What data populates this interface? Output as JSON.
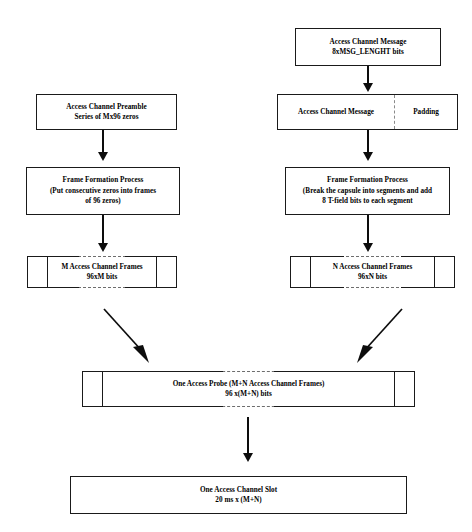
{
  "diagram": {
    "colors": {
      "stroke": "#1a1a1a",
      "dashed": "#6d6d6d",
      "background": "#ffffff",
      "text": "#000000"
    },
    "nodes": {
      "access_channel_message_top": {
        "line1": "Access Channel Message",
        "line2": "8xMSG_LENGHT bits"
      },
      "access_channel_preamble": {
        "line1": "Access Channel Preamble",
        "line2": "Series of Mx96 zeros"
      },
      "message_with_padding": {
        "message_label": "Access Channel Message",
        "padding_label": "Padding"
      },
      "frame_formation_left": {
        "line1": "Frame Formation Process",
        "line2": "(Put consecutive zeros into frames",
        "line3": "of 96 zeros)"
      },
      "frame_formation_right": {
        "line1": "Frame Formation Process",
        "line2": "(Break the capsule into segments and add",
        "line3": "8 T-field bits to each segment"
      },
      "m_frames": {
        "line1": "M Access Channel Frames",
        "line2": "96xM bits"
      },
      "n_frames": {
        "line1": "N Access Channel Frames",
        "line2": "96xN bits"
      },
      "access_probe": {
        "line1": "One Access Probe (M+N Access Channel Frames)",
        "line2": "96 x(M+N) bits"
      },
      "access_channel_slot": {
        "line1": "One Access Channel Slot",
        "line2": "20 ms x (M+N)"
      }
    },
    "connectors": [
      {
        "name": "message-to-padded-message",
        "type": "arrow-down"
      },
      {
        "name": "preamble-to-frame-formation",
        "type": "arrow-down"
      },
      {
        "name": "padded-message-to-frame-formation",
        "type": "arrow-down"
      },
      {
        "name": "frame-formation-to-m-frames",
        "type": "arrow-down"
      },
      {
        "name": "frame-formation-to-n-frames",
        "type": "arrow-down"
      },
      {
        "name": "m-frames-to-probe",
        "type": "arrow-diagonal-right-down"
      },
      {
        "name": "n-frames-to-probe",
        "type": "arrow-diagonal-left-down"
      },
      {
        "name": "probe-to-slot",
        "type": "arrow-down"
      }
    ]
  }
}
